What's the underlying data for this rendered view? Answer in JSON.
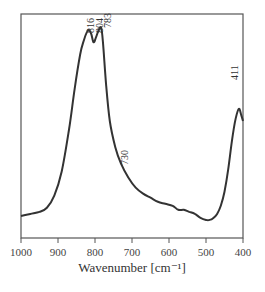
{
  "chart_data": {
    "type": "line",
    "title": "",
    "xlabel": "Wavenumber [cm⁻¹]",
    "ylabel": "",
    "xlim": [
      1000,
      400
    ],
    "x_reversed": true,
    "grid": false,
    "legend": null,
    "xticks": [
      1000,
      900,
      800,
      700,
      600,
      500,
      400
    ],
    "xtick_labels": [
      "1000",
      "900",
      "800",
      "700",
      "600",
      "500",
      "400"
    ],
    "series": [
      {
        "name": "spectrum",
        "color": "#333333",
        "x": [
          1000,
          975,
          950,
          930,
          910,
          890,
          870,
          855,
          840,
          830,
          822,
          816,
          810,
          804,
          798,
          790,
          783,
          778,
          770,
          760,
          745,
          730,
          710,
          690,
          670,
          650,
          630,
          610,
          590,
          575,
          560,
          545,
          530,
          515,
          500,
          490,
          480,
          470,
          460,
          450,
          440,
          430,
          420,
          411,
          405,
          400
        ],
        "y": [
          0.05,
          0.06,
          0.07,
          0.09,
          0.15,
          0.27,
          0.48,
          0.68,
          0.85,
          0.92,
          0.96,
          0.97,
          0.95,
          0.91,
          0.93,
          0.97,
          0.98,
          0.9,
          0.7,
          0.52,
          0.39,
          0.31,
          0.24,
          0.19,
          0.16,
          0.14,
          0.12,
          0.11,
          0.1,
          0.08,
          0.08,
          0.07,
          0.06,
          0.04,
          0.03,
          0.03,
          0.04,
          0.06,
          0.1,
          0.17,
          0.28,
          0.42,
          0.53,
          0.58,
          0.55,
          0.52
        ]
      }
    ],
    "annotations": [
      {
        "text": "816",
        "x": 816,
        "rotation": -90
      },
      {
        "text": "804",
        "x": 804,
        "rotation": -90
      },
      {
        "text": "783",
        "x": 783,
        "rotation": -90
      },
      {
        "text": "730",
        "x": 730,
        "rotation": -90
      },
      {
        "text": "411",
        "x": 411,
        "rotation": -90
      }
    ]
  }
}
